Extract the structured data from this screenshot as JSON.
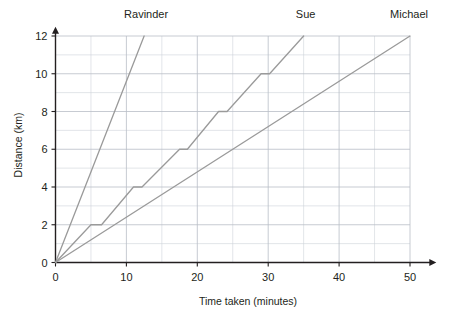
{
  "chart_data": {
    "type": "line",
    "title": "",
    "xlabel": "Time taken (minutes)",
    "ylabel": "Distance (km)",
    "xlim": [
      0,
      52
    ],
    "ylim": [
      0,
      12.6
    ],
    "grid": true,
    "grid_major_x_step": 10,
    "grid_minor_x_step": 5,
    "grid_major_y_step": 2,
    "grid_minor_y_step": 1,
    "legend_position": "above-line-ends",
    "xticks": [
      0,
      10,
      20,
      30,
      40,
      50
    ],
    "xticklabels": [
      "0",
      "10",
      "20",
      "30",
      "40",
      "50"
    ],
    "yticks": [
      0,
      2,
      4,
      6,
      8,
      10,
      12
    ],
    "yticklabels": [
      "0",
      "2",
      "4",
      "6",
      "8",
      "10",
      "12"
    ],
    "series": [
      {
        "name": "Ravinder",
        "color": "#9a9a9a",
        "label_x": 12.5,
        "label_y": 12,
        "points": [
          [
            0,
            0
          ],
          [
            12.5,
            12
          ]
        ]
      },
      {
        "name": "Sue",
        "color": "#9a9a9a",
        "label_x": 35,
        "label_y": 12,
        "points": [
          [
            0,
            0
          ],
          [
            5,
            2
          ],
          [
            6.5,
            2
          ],
          [
            11,
            4
          ],
          [
            12.2,
            4
          ],
          [
            17.5,
            6
          ],
          [
            18.6,
            6
          ],
          [
            23,
            8
          ],
          [
            24.2,
            8
          ],
          [
            29,
            10
          ],
          [
            30.2,
            10
          ],
          [
            35,
            12
          ]
        ]
      },
      {
        "name": "Michael",
        "color": "#9a9a9a",
        "label_x": 50,
        "label_y": 12,
        "points": [
          [
            0,
            0
          ],
          [
            50,
            12
          ]
        ]
      }
    ]
  },
  "axes": {
    "x_axis_title": "Time taken (minutes)",
    "y_axis_title": "Distance (km)"
  },
  "series_labels": {
    "ravinder": "Ravinder",
    "sue": "Sue",
    "michael": "Michael"
  },
  "xticklabels": {
    "t0": "0",
    "t1": "10",
    "t2": "20",
    "t3": "30",
    "t4": "40",
    "t5": "50"
  },
  "yticklabels": {
    "v0": "0",
    "v1": "2",
    "v2": "4",
    "v3": "6",
    "v4": "8",
    "v5": "10",
    "v6": "12"
  }
}
